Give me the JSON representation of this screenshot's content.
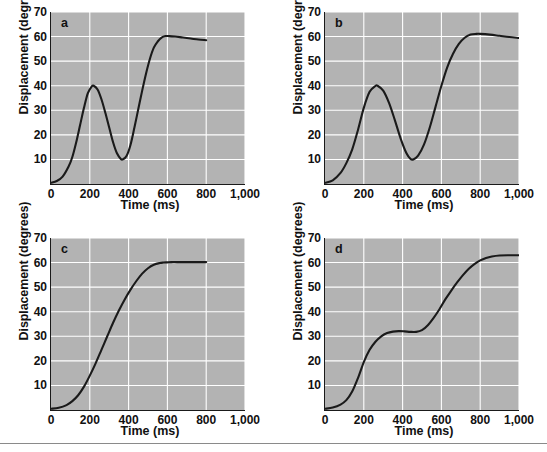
{
  "figure": {
    "background_color": "#ffffff",
    "plot_background_color": "#b3b3b3",
    "grid_color": "#ffffff",
    "curve_color": "#1a1a1a",
    "axis_color": "#1a1a1a"
  },
  "chart_data": [
    {
      "type": "line",
      "panel": "a",
      "title": "a",
      "xlabel": "Time (ms)",
      "ylabel": "Displacement (degrees)",
      "xlim": [
        0,
        1000
      ],
      "ylim": [
        0,
        70
      ],
      "xticks": [
        0,
        200,
        400,
        600,
        800,
        1000
      ],
      "xticklabels": [
        "0",
        "200",
        "400",
        "600",
        "800",
        "1,000"
      ],
      "yticks": [
        10,
        20,
        30,
        40,
        50,
        60,
        70
      ],
      "yticklabels": [
        "10",
        "20",
        "30",
        "40",
        "50",
        "60",
        "70"
      ],
      "grid": true,
      "legend": "none",
      "x": [
        0,
        30,
        60,
        90,
        110,
        130,
        150,
        170,
        190,
        210,
        220,
        240,
        260,
        280,
        300,
        320,
        340,
        360,
        370,
        390,
        410,
        430,
        450,
        470,
        490,
        510,
        530,
        550,
        570,
        590,
        610,
        640,
        680,
        720,
        760,
        800
      ],
      "y": [
        0.5,
        1.2,
        3.0,
        7.0,
        11.0,
        17.0,
        24.0,
        31.0,
        37.0,
        39.7,
        40.0,
        38.5,
        34.5,
        29.0,
        23.0,
        17.0,
        12.5,
        10.2,
        10.0,
        11.5,
        16.0,
        23.0,
        30.5,
        38.0,
        45.0,
        51.0,
        55.5,
        58.0,
        59.6,
        60.2,
        60.2,
        60.0,
        59.6,
        59.2,
        58.8,
        58.5
      ]
    },
    {
      "type": "line",
      "panel": "b",
      "title": "b",
      "xlabel": "Time (ms)",
      "ylabel": "Displacement (degrees)",
      "xlim": [
        0,
        1000
      ],
      "ylim": [
        0,
        70
      ],
      "xticks": [
        0,
        200,
        400,
        600,
        800,
        1000
      ],
      "xticklabels": [
        "0",
        "200",
        "400",
        "600",
        "800",
        "1,000"
      ],
      "yticks": [
        10,
        20,
        30,
        40,
        50,
        60,
        70
      ],
      "yticklabels": [
        "10",
        "20",
        "30",
        "40",
        "50",
        "60",
        "70"
      ],
      "grid": true,
      "legend": "none",
      "x": [
        0,
        40,
        80,
        110,
        140,
        170,
        200,
        230,
        260,
        270,
        300,
        330,
        360,
        390,
        420,
        440,
        455,
        480,
        510,
        540,
        570,
        600,
        630,
        660,
        690,
        720,
        750,
        780,
        800,
        850,
        900,
        950,
        1000
      ],
      "y": [
        0.5,
        1.5,
        4.5,
        8.5,
        14.0,
        22.0,
        31.0,
        37.5,
        39.9,
        40.0,
        38.0,
        33.0,
        26.0,
        18.5,
        12.5,
        10.3,
        10.0,
        11.5,
        16.0,
        23.0,
        31.5,
        40.0,
        47.5,
        53.0,
        57.0,
        59.5,
        60.8,
        61.1,
        61.1,
        60.8,
        60.3,
        59.8,
        59.4
      ]
    },
    {
      "type": "line",
      "panel": "c",
      "title": "c",
      "xlabel": "Time (ms)",
      "ylabel": "Displacement (degrees)",
      "xlim": [
        0,
        1000
      ],
      "ylim": [
        0,
        70
      ],
      "xticks": [
        0,
        200,
        400,
        600,
        800,
        1000
      ],
      "xticklabels": [
        "0",
        "200",
        "400",
        "600",
        "800",
        "1,000"
      ],
      "yticks": [
        10,
        20,
        30,
        40,
        50,
        60,
        70
      ],
      "yticklabels": [
        "10",
        "20",
        "30",
        "40",
        "50",
        "60",
        "70"
      ],
      "grid": true,
      "legend": "none",
      "x": [
        0,
        40,
        80,
        110,
        140,
        170,
        200,
        230,
        260,
        290,
        320,
        350,
        380,
        410,
        440,
        470,
        500,
        530,
        560,
        580,
        600,
        620,
        650,
        700,
        750,
        800
      ],
      "y": [
        0.5,
        0.9,
        2.0,
        3.6,
        6.0,
        9.5,
        14.0,
        19.0,
        24.5,
        30.0,
        35.5,
        40.5,
        45.0,
        49.0,
        52.5,
        55.5,
        57.7,
        59.1,
        59.8,
        60.0,
        60.1,
        60.2,
        60.2,
        60.2,
        60.2,
        60.2
      ]
    },
    {
      "type": "line",
      "panel": "d",
      "title": "d",
      "xlabel": "Time (ms)",
      "ylabel": "Displacement (degrees)",
      "xlim": [
        0,
        1000
      ],
      "ylim": [
        0,
        70
      ],
      "xticks": [
        0,
        200,
        400,
        600,
        800,
        1000
      ],
      "xticklabels": [
        "0",
        "200",
        "400",
        "600",
        "800",
        "1,000"
      ],
      "yticks": [
        10,
        20,
        30,
        40,
        50,
        60,
        70
      ],
      "yticklabels": [
        "10",
        "20",
        "30",
        "40",
        "50",
        "60",
        "70"
      ],
      "grid": true,
      "legend": "none",
      "x": [
        0,
        40,
        80,
        110,
        140,
        170,
        200,
        230,
        260,
        290,
        320,
        350,
        380,
        410,
        440,
        470,
        500,
        530,
        560,
        590,
        620,
        650,
        680,
        710,
        740,
        770,
        800,
        830,
        860,
        900,
        950,
        1000
      ],
      "y": [
        0.5,
        1.0,
        2.2,
        4.0,
        7.5,
        13.0,
        19.5,
        24.5,
        27.8,
        30.0,
        31.3,
        31.9,
        32.1,
        32.0,
        31.8,
        31.8,
        32.5,
        34.5,
        37.5,
        41.0,
        45.0,
        48.5,
        51.8,
        54.8,
        57.4,
        59.4,
        60.9,
        61.9,
        62.5,
        62.9,
        63.0,
        63.0
      ]
    }
  ],
  "panels": {
    "a": {
      "letter": "a",
      "xlabel": "Time (ms)",
      "ylabel": "Displacement (degrees)"
    },
    "b": {
      "letter": "b",
      "xlabel": "Time (ms)",
      "ylabel": "Displacement (degrees)"
    },
    "c": {
      "letter": "c",
      "xlabel": "Time (ms)",
      "ylabel": "Displacement (degrees)"
    },
    "d": {
      "letter": "d",
      "xlabel": "Time (ms)",
      "ylabel": "Displacement (degrees)"
    }
  }
}
